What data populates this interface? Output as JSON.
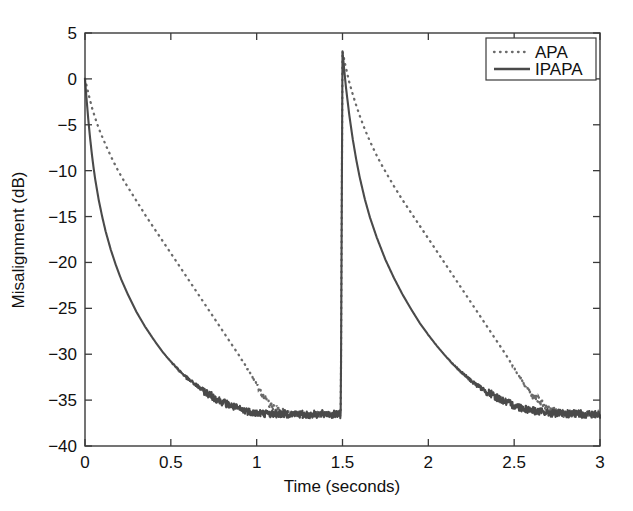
{
  "chart_data": {
    "type": "line",
    "title": "",
    "xlabel": "Time (seconds)",
    "ylabel": "Misalignment (dB)",
    "xlim": [
      0,
      3
    ],
    "ylim": [
      -40,
      5
    ],
    "xticks": [
      0,
      0.5,
      1,
      1.5,
      2,
      2.5,
      3
    ],
    "xtick_labels": [
      "0",
      "0.5",
      "1",
      "1.5",
      "2",
      "2.5",
      "3"
    ],
    "yticks": [
      5,
      0,
      -5,
      -10,
      -15,
      -20,
      -25,
      -30,
      -35,
      -40
    ],
    "ytick_labels": [
      "5",
      "0",
      "-5",
      "-10",
      "-15",
      "-20",
      "-25",
      "-30",
      "-35",
      "-40"
    ],
    "grid": false,
    "legend_position": "upper right",
    "legend": [
      "APA",
      "IPAPA"
    ],
    "annotations": {
      "echo_path_change_time": 1.5,
      "peak_after_change_db": 3,
      "steady_state_db": -36.5,
      "initial_value_db": 0
    },
    "series": [
      {
        "name": "APA",
        "style": "dotted",
        "color": "#6a6a6a",
        "x": [
          0,
          0.02,
          0.04,
          0.06,
          0.08,
          0.1,
          0.13,
          0.16,
          0.19,
          0.22,
          0.25,
          0.3,
          0.35,
          0.4,
          0.45,
          0.5,
          0.55,
          0.6,
          0.65,
          0.7,
          0.75,
          0.8,
          0.85,
          0.9,
          0.95,
          1.0,
          1.05,
          1.1,
          1.2,
          1.3,
          1.4,
          1.49,
          1.5,
          1.52,
          1.54,
          1.56,
          1.58,
          1.6,
          1.63,
          1.66,
          1.69,
          1.72,
          1.75,
          1.8,
          1.85,
          1.9,
          1.95,
          2.0,
          2.05,
          2.1,
          2.15,
          2.2,
          2.25,
          2.3,
          2.35,
          2.4,
          2.45,
          2.5,
          2.55,
          2.6,
          2.7,
          2.8,
          2.9,
          3.0
        ],
        "y": [
          0,
          -1.6,
          -3.1,
          -4.3,
          -5.4,
          -6.3,
          -7.6,
          -8.8,
          -9.9,
          -10.9,
          -11.8,
          -13.3,
          -14.8,
          -16.2,
          -17.6,
          -19.0,
          -20.4,
          -21.8,
          -23.2,
          -24.6,
          -26.0,
          -27.4,
          -28.8,
          -30.2,
          -31.7,
          -33.3,
          -34.8,
          -35.9,
          -36.5,
          -36.6,
          -36.5,
          -36.6,
          3.0,
          1.2,
          -0.4,
          -1.7,
          -2.9,
          -4.0,
          -5.5,
          -6.8,
          -8.0,
          -9.1,
          -10.1,
          -11.7,
          -13.2,
          -14.6,
          -16.0,
          -17.4,
          -18.8,
          -20.2,
          -21.6,
          -23.0,
          -24.4,
          -25.8,
          -27.2,
          -28.6,
          -30.0,
          -31.5,
          -33.0,
          -34.4,
          -36.0,
          -36.5,
          -36.5,
          -36.6
        ]
      },
      {
        "name": "IPAPA",
        "style": "solid",
        "color": "#4a4a4a",
        "x": [
          0,
          0.01,
          0.02,
          0.03,
          0.04,
          0.05,
          0.06,
          0.08,
          0.1,
          0.12,
          0.15,
          0.18,
          0.21,
          0.25,
          0.3,
          0.35,
          0.4,
          0.45,
          0.5,
          0.55,
          0.6,
          0.65,
          0.7,
          0.75,
          0.8,
          0.85,
          0.9,
          0.95,
          1.0,
          1.1,
          1.2,
          1.3,
          1.4,
          1.49,
          1.5,
          1.51,
          1.52,
          1.54,
          1.56,
          1.58,
          1.6,
          1.63,
          1.66,
          1.7,
          1.75,
          1.8,
          1.85,
          1.9,
          1.95,
          2.0,
          2.05,
          2.1,
          2.15,
          2.2,
          2.25,
          2.3,
          2.35,
          2.4,
          2.45,
          2.5,
          2.6,
          2.7,
          2.8,
          2.9,
          3.0
        ],
        "y": [
          0,
          -2.4,
          -4.6,
          -6.5,
          -8.2,
          -9.7,
          -11.0,
          -13.2,
          -15.0,
          -16.6,
          -18.6,
          -20.3,
          -21.8,
          -23.5,
          -25.4,
          -27.0,
          -28.4,
          -29.7,
          -30.8,
          -31.8,
          -32.7,
          -33.4,
          -34.1,
          -34.7,
          -35.2,
          -35.6,
          -36.0,
          -36.2,
          -36.4,
          -36.5,
          -36.5,
          -36.6,
          -36.5,
          -36.6,
          3.0,
          1.0,
          -0.9,
          -4.0,
          -6.6,
          -8.8,
          -10.7,
          -13.1,
          -15.1,
          -17.3,
          -19.7,
          -21.7,
          -23.5,
          -25.1,
          -26.6,
          -27.9,
          -29.1,
          -30.2,
          -31.2,
          -32.1,
          -32.9,
          -33.6,
          -34.2,
          -34.7,
          -35.2,
          -35.6,
          -36.1,
          -36.4,
          -36.5,
          -36.5,
          -36.6
        ]
      }
    ]
  },
  "legend": {
    "entries": [
      {
        "label": "APA",
        "style": "dotted"
      },
      {
        "label": "IPAPA",
        "style": "solid"
      }
    ]
  },
  "axes": {
    "x_title": "Time (seconds)",
    "y_title": "Misalignment (dB)"
  }
}
